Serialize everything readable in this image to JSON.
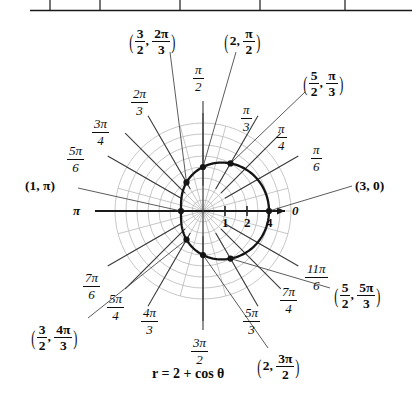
{
  "figure": {
    "equation": "r = 2 + cos θ",
    "center": {
      "x": 203,
      "y": 211
    },
    "unit_px": 22,
    "table_fragment": {
      "present": true,
      "description": "bottom border of a table with vertical column dividers",
      "divider_x": [
        50,
        100,
        180,
        260,
        345
      ],
      "border_y": 10,
      "left": 30,
      "right": 412
    },
    "axis_labels": {
      "right": "0",
      "left": "π"
    },
    "radial_ticks": [
      {
        "label": "1",
        "value": 1
      },
      {
        "label": "2",
        "value": 2
      },
      {
        "label": "4",
        "value": 4
      }
    ],
    "angle_labels": [
      {
        "num": "π",
        "den": "2",
        "deg": 90
      },
      {
        "num": "2π",
        "den": "3",
        "deg": 120
      },
      {
        "num": "3π",
        "den": "4",
        "deg": 135
      },
      {
        "num": "5π",
        "den": "6",
        "deg": 150
      },
      {
        "num": "7π",
        "den": "6",
        "deg": 210
      },
      {
        "num": "5π",
        "den": "4",
        "deg": 225
      },
      {
        "num": "4π",
        "den": "3",
        "deg": 240
      },
      {
        "num": "3π",
        "den": "2",
        "deg": 270
      },
      {
        "num": "5π",
        "den": "3",
        "deg": 300
      },
      {
        "num": "7π",
        "den": "4",
        "deg": 315
      },
      {
        "num": "11π",
        "den": "6",
        "deg": 330
      },
      {
        "num": "π",
        "den": "3",
        "deg": 60
      },
      {
        "num": "π",
        "den": "4",
        "deg": 45
      },
      {
        "num": "π",
        "den": "6",
        "deg": 30
      }
    ],
    "points": [
      {
        "r_text": "3",
        "r_value": 3,
        "theta_text": "0",
        "label": "(3, 0)",
        "deg": 0
      },
      {
        "r_num": "5",
        "r_den": "2",
        "r_value": 2.5,
        "theta_num": "π",
        "theta_den": "3",
        "deg": 60
      },
      {
        "r_text": "2",
        "r_value": 2,
        "theta_num": "π",
        "theta_den": "2",
        "deg": 90
      },
      {
        "r_num": "3",
        "r_den": "2",
        "r_value": 1.5,
        "theta_num": "2π",
        "theta_den": "3",
        "deg": 120
      },
      {
        "r_text": "1",
        "r_value": 1,
        "theta_text": "π",
        "label": "(1, π)",
        "deg": 180
      },
      {
        "r_num": "3",
        "r_den": "2",
        "r_value": 1.5,
        "theta_num": "4π",
        "theta_den": "3",
        "deg": 240
      },
      {
        "r_text": "2",
        "r_value": 2,
        "theta_num": "3π",
        "theta_den": "2",
        "deg": 270
      },
      {
        "r_num": "5",
        "r_den": "2",
        "r_value": 2.5,
        "theta_num": "5π",
        "theta_den": "3",
        "deg": 300
      }
    ]
  },
  "chart_data": {
    "type": "line",
    "title": "r = 2 + cos θ",
    "coordinate_system": "polar",
    "xlabel": "",
    "ylabel": "",
    "grid": true,
    "legend": "none",
    "rlim": [
      0,
      4
    ],
    "r_ticks": [
      1,
      2,
      4
    ],
    "theta_ticks_deg": [
      0,
      30,
      45,
      60,
      90,
      120,
      135,
      150,
      180,
      210,
      225,
      240,
      270,
      300,
      315,
      330
    ],
    "series": [
      {
        "name": "r = 2 + cos θ",
        "theta_deg": [
          0,
          30,
          45,
          60,
          90,
          120,
          135,
          150,
          180,
          210,
          225,
          240,
          270,
          300,
          315,
          330,
          360
        ],
        "r": [
          3,
          2.87,
          2.71,
          2.5,
          2,
          1.5,
          1.29,
          1.13,
          1,
          1.13,
          1.29,
          1.5,
          2,
          2.5,
          2.71,
          2.87,
          3
        ]
      }
    ],
    "marked_points": [
      {
        "r": 3,
        "theta_deg": 0,
        "label": "(3, 0)"
      },
      {
        "r": 2.5,
        "theta_deg": 60,
        "label": "(5/2, π/3)"
      },
      {
        "r": 2,
        "theta_deg": 90,
        "label": "(2, π/2)"
      },
      {
        "r": 1.5,
        "theta_deg": 120,
        "label": "(3/2, 2π/3)"
      },
      {
        "r": 1,
        "theta_deg": 180,
        "label": "(1, π)"
      },
      {
        "r": 1.5,
        "theta_deg": 240,
        "label": "(3/2, 4π/3)"
      },
      {
        "r": 2,
        "theta_deg": 270,
        "label": "(2, 3π/2)"
      },
      {
        "r": 2.5,
        "theta_deg": 300,
        "label": "(5/2, 5π/3)"
      }
    ]
  }
}
